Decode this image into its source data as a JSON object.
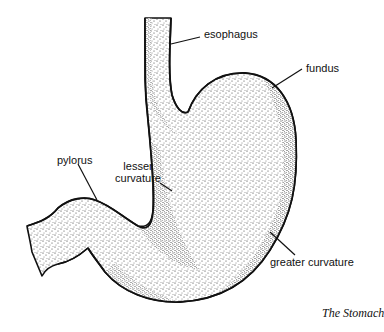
{
  "figure": {
    "caption": "The Stomach",
    "labels": {
      "esophagus": "esophagus",
      "fundus": "fundus",
      "pylorus": "pylorus",
      "lesser_curvature_line1": "lesser",
      "lesser_curvature_line2": "curvature",
      "greater_curvature": "greater curvature"
    },
    "colors": {
      "ink": "#111111",
      "background": "#ffffff"
    }
  }
}
